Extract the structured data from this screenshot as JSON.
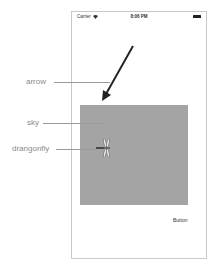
{
  "status_bar": {
    "carrier": "Carrier",
    "time": "8:06 PM",
    "icons": [
      "wifi-icon",
      "battery-icon"
    ]
  },
  "screen": {
    "button_label": "Button",
    "sky_color": "#a4a4a4"
  },
  "annotations": [
    {
      "label": "arrow",
      "target": "arrow"
    },
    {
      "label": "sky",
      "target": "sky-view"
    },
    {
      "label": "drangonfly",
      "target": "dragonfly"
    }
  ]
}
